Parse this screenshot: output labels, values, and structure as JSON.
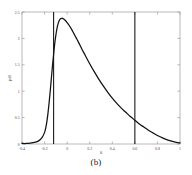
{
  "figure": {
    "caption": "(b)"
  },
  "chart_data": {
    "type": "line",
    "title": "",
    "subtitle": "",
    "xlabel": "θ",
    "ylabel": "pdf",
    "xlim": [
      -0.4,
      1.0
    ],
    "ylim": [
      0,
      2.5
    ],
    "grid": false,
    "legend": null,
    "xticks": [
      -0.4,
      -0.2,
      0,
      0.2,
      0.4,
      0.6,
      0.8,
      1
    ],
    "xticklabels": [
      "-0.4",
      "-0.2",
      "0",
      "0.2",
      "0.4",
      "0.6",
      "0.8",
      "1"
    ],
    "yticks": [
      0,
      0.5,
      1,
      1.5,
      2,
      2.5
    ],
    "yticklabels": [
      "0",
      "0.5",
      "1",
      "1.5",
      "2",
      "2.5"
    ],
    "series": [
      {
        "name": "pdf",
        "x": [
          -0.4,
          -0.36,
          -0.32,
          -0.29,
          -0.26,
          -0.24,
          -0.22,
          -0.2,
          -0.19,
          -0.18,
          -0.17,
          -0.16,
          -0.15,
          -0.14,
          -0.13,
          -0.12,
          -0.11,
          -0.1,
          -0.09,
          -0.08,
          -0.07,
          -0.06,
          -0.05,
          -0.04,
          -0.02,
          0.0,
          0.02,
          0.04,
          0.06,
          0.08,
          0.1,
          0.13,
          0.16,
          0.2,
          0.24,
          0.28,
          0.32,
          0.36,
          0.4,
          0.44,
          0.48,
          0.52,
          0.56,
          0.6,
          0.64,
          0.68,
          0.72,
          0.76,
          0.8,
          0.85,
          0.9,
          0.95,
          1.0
        ],
        "y": [
          0.01,
          0.01,
          0.02,
          0.03,
          0.05,
          0.08,
          0.13,
          0.22,
          0.3,
          0.42,
          0.58,
          0.78,
          1.0,
          1.24,
          1.48,
          1.7,
          1.9,
          2.06,
          2.19,
          2.28,
          2.34,
          2.37,
          2.38,
          2.38,
          2.35,
          2.3,
          2.24,
          2.17,
          2.09,
          2.01,
          1.93,
          1.8,
          1.68,
          1.52,
          1.37,
          1.23,
          1.1,
          0.98,
          0.87,
          0.77,
          0.68,
          0.6,
          0.52,
          0.45,
          0.38,
          0.32,
          0.26,
          0.21,
          0.16,
          0.11,
          0.07,
          0.04,
          0.02
        ]
      }
    ],
    "annotations": [
      {
        "name": "lower-bound-line",
        "type": "vline",
        "x": -0.12
      },
      {
        "name": "upper-bound-line",
        "type": "vline",
        "x": 0.6
      }
    ],
    "colors": {
      "curve": "#111111",
      "vline": "#1a1a1a",
      "axis": "#9a9a9a",
      "text": "#4a4a4a",
      "background": "#ffffff"
    }
  }
}
